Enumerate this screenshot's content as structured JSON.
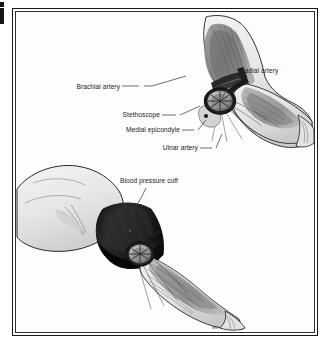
{
  "figure": {
    "kind": "medical-anatomy-illustration",
    "style": "grayscale halftone line-and-wash drawing",
    "frame": {
      "style": "double-line rectangle",
      "color": "#17181a"
    },
    "background_color": "#ffffff",
    "signature": "MC"
  },
  "palette": {
    "ink": "#17181a",
    "label_text": "#1b1c1e",
    "leader_line": "#3c3e41",
    "skin_light": "#ededed",
    "skin_mid": "#dcdcdc",
    "skin_shadow": "#c2c2c2",
    "muscle_light": "#b9b9b9",
    "muscle_mid": "#8f8f8f",
    "muscle_dark": "#5e5e5e",
    "vessel_dark": "#3a3a3a",
    "cuff_black": "#1c1c1c",
    "cuff_highlight": "#4a4a4a",
    "stethoscope_ring": "#242424",
    "stethoscope_face": "#bdbdbd"
  },
  "panels": [
    {
      "id": "upper-arm-view",
      "name": "Flexed arm with stethoscope over antecubital fossa",
      "description": "Arm shown with skin rendered translucent to reveal biceps, brachialis and forearm musculature; stethoscope chest-piece positioned over the brachial artery."
    },
    {
      "id": "lower-arm-view",
      "name": "Arm with blood pressure cuff applied",
      "description": "Upper arm encircled by an inflated blood pressure cuff with the stethoscope chest-piece tucked at the distal cuff edge over the antecubital fossa."
    }
  ],
  "labels": [
    {
      "id": "brachial-artery",
      "text": "Brachial artery",
      "align": "right",
      "x": 118,
      "y": 88,
      "panel": "upper-arm-view"
    },
    {
      "id": "radial-artery",
      "text": "Radial artery",
      "align": "left",
      "x": 240,
      "y": 72,
      "panel": "upper-arm-view"
    },
    {
      "id": "stethoscope",
      "text": "Stethoscope",
      "align": "right",
      "x": 158,
      "y": 117,
      "panel": "upper-arm-view"
    },
    {
      "id": "medial-epicondyle",
      "text": "Medial epicondyle",
      "align": "right",
      "x": 178,
      "y": 132,
      "panel": "upper-arm-view"
    },
    {
      "id": "ulnar-artery",
      "text": "Ulnar artery",
      "align": "right",
      "x": 196,
      "y": 150,
      "panel": "upper-arm-view"
    },
    {
      "id": "blood-pressure-cuff",
      "text": "Blood pressure cuff",
      "align": "left",
      "x": 120,
      "y": 181,
      "panel": "lower-arm-view"
    }
  ],
  "signature_mark": {
    "text": "MC",
    "x": 212,
    "y": 327
  }
}
